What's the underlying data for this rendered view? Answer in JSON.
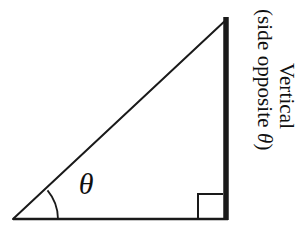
{
  "diagram": {
    "canvas": {
      "width": 305,
      "height": 241,
      "background": "#ffffff"
    },
    "stroke_color": "#1a1a1a",
    "angle_symbol": "θ",
    "labels": {
      "vertical_line1": "Vertical",
      "vertical_line2_prefix": "(side opposite ",
      "vertical_line2_theta": "θ",
      "vertical_line2_suffix": ")",
      "vertical_full": "Vertical (side opposite θ)"
    },
    "geometry": {
      "left_vertex": {
        "x": 13,
        "y": 219
      },
      "top_vertex": {
        "x": 227,
        "y": 19
      },
      "right_vertex": {
        "x": 227,
        "y": 219
      },
      "hypotenuse_width": 2,
      "base_width": 2.4,
      "vertical_width": 5.5,
      "arc_radius": 45,
      "right_angle_box_size": 25
    }
  }
}
